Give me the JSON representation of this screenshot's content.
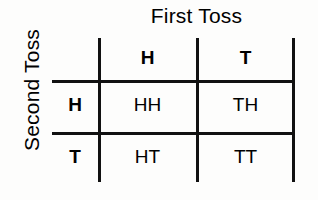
{
  "figure": {
    "column_axis_title": "First Toss",
    "row_axis_title": "Second Toss",
    "line_color": "#111111",
    "text_color": "#000000",
    "background_color": "#fdfdfc"
  },
  "table": {
    "column_headers": [
      "H",
      "T"
    ],
    "row_headers": [
      "H",
      "T"
    ],
    "rows": [
      {
        "label": "H",
        "cells": [
          "HH",
          "TH"
        ]
      },
      {
        "label": "T",
        "cells": [
          "HT",
          "TT"
        ]
      }
    ]
  }
}
